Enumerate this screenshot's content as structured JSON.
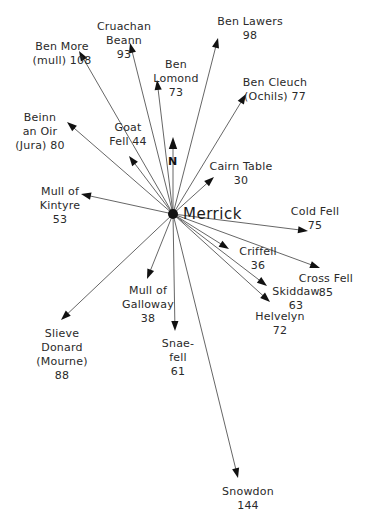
{
  "diagram": {
    "center": {
      "name": "Merrick",
      "x": 173,
      "y": 214
    },
    "north_label": "N",
    "colors": {
      "line": "#555555",
      "arrow": "#111111",
      "text": "#2a2a2a",
      "background": "#ffffff"
    },
    "destinations": [
      {
        "id": "ben-more",
        "lines": [
          "Ben More",
          "(mull) 108"
        ],
        "name": "Ben More (Mull)",
        "distance": 108,
        "tip": [
          79,
          51
        ],
        "label_x": 62,
        "label_y": 40
      },
      {
        "id": "cruachan",
        "lines": [
          "Cruachan",
          "Beann",
          "93"
        ],
        "name": "Cruachan Beann",
        "distance": 93,
        "tip": [
          130,
          43
        ],
        "label_x": 124,
        "label_y": 20
      },
      {
        "id": "ben-lamond",
        "lines": [
          "Ben",
          "Lomond",
          "73"
        ],
        "name": "Ben Lomond",
        "distance": 73,
        "tip": [
          157,
          80
        ],
        "label_x": 176,
        "label_y": 58
      },
      {
        "id": "ben-lawers",
        "lines": [
          "Ben Lawers",
          "98"
        ],
        "name": "Ben Lawers",
        "distance": 98,
        "tip": [
          218,
          38
        ],
        "label_x": 250,
        "label_y": 15
      },
      {
        "id": "ben-cleuch",
        "lines": [
          "Ben Cleuch",
          "(Ochils) 77"
        ],
        "name": "Ben Cleuch (Ochils)",
        "distance": 77,
        "tip": [
          246,
          94
        ],
        "label_x": 275,
        "label_y": 76
      },
      {
        "id": "beinn-an-oir",
        "lines": [
          "Beinn",
          "an Oir",
          "(Jura) 80"
        ],
        "name": "Beinn an Oir (Jura)",
        "distance": 80,
        "tip": [
          67,
          122
        ],
        "label_x": 40,
        "label_y": 111
      },
      {
        "id": "goat-fell",
        "lines": [
          "Goat",
          "Fell 44"
        ],
        "name": "Goat Fell",
        "distance": 44,
        "tip": [
          129,
          156
        ],
        "label_x": 128,
        "label_y": 121
      },
      {
        "id": "cairn-table",
        "lines": [
          "Cairn Table",
          "30"
        ],
        "name": "Cairn Table",
        "distance": 30,
        "tip": [
          214,
          177
        ],
        "label_x": 241,
        "label_y": 160
      },
      {
        "id": "mull-of-kintyre",
        "lines": [
          "Mull of",
          "Kintyre",
          "53"
        ],
        "name": "Mull of Kintyre",
        "distance": 53,
        "tip": [
          81,
          194
        ],
        "label_x": 60,
        "label_y": 185
      },
      {
        "id": "cold-fell",
        "lines": [
          "Cold Fell",
          "75"
        ],
        "name": "Cold Fell",
        "distance": 75,
        "tip": [
          308,
          231
        ],
        "label_x": 315,
        "label_y": 205
      },
      {
        "id": "criffell",
        "lines": [
          "Criffell",
          "36"
        ],
        "name": "Criffell",
        "distance": 36,
        "tip": [
          229,
          249
        ],
        "label_x": 258,
        "label_y": 245
      },
      {
        "id": "cross-fell",
        "lines": [
          "Cross Fell",
          "85"
        ],
        "name": "Cross Fell",
        "distance": 85,
        "tip": [
          320,
          268
        ],
        "label_x": 326,
        "label_y": 272
      },
      {
        "id": "skiddaw",
        "lines": [
          "Skiddaw",
          "63"
        ],
        "name": "Skiddaw",
        "distance": 63,
        "tip": [
          267,
          286
        ],
        "label_x": 296,
        "label_y": 285
      },
      {
        "id": "helvelyn",
        "lines": [
          "Helvelyn",
          "72"
        ],
        "name": "Helvelyn",
        "distance": 72,
        "tip": [
          270,
          302
        ],
        "label_x": 280,
        "label_y": 310
      },
      {
        "id": "mull-of-galloway",
        "lines": [
          "Mull of",
          "Galloway",
          "38"
        ],
        "name": "Mull of Galloway",
        "distance": 38,
        "tip": [
          147,
          279
        ],
        "label_x": 148,
        "label_y": 284
      },
      {
        "id": "slieve-donard",
        "lines": [
          "Slieve",
          "Donard",
          "(Mourne)",
          "88"
        ],
        "name": "Slieve Donard (Mourne)",
        "distance": 88,
        "tip": [
          61,
          320
        ],
        "label_x": 62,
        "label_y": 327
      },
      {
        "id": "snaefell",
        "lines": [
          "Snae-",
          "fell",
          "61"
        ],
        "name": "Snaefell",
        "distance": 61,
        "tip": [
          175,
          331
        ],
        "label_x": 178,
        "label_y": 337
      },
      {
        "id": "snowdon",
        "lines": [
          "Snowdon",
          "144"
        ],
        "name": "Snowdon",
        "distance": 144,
        "tip": [
          238,
          478
        ],
        "label_x": 248,
        "label_y": 485
      }
    ]
  }
}
